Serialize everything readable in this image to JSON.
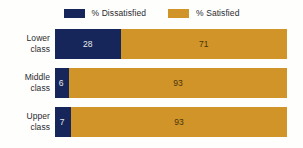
{
  "chart_data": {
    "type": "bar",
    "orientation": "horizontal",
    "stacked": true,
    "title": "",
    "subtitle": "",
    "xlabel": "",
    "ylabel": "",
    "xlim": [
      0,
      100
    ],
    "grid": false,
    "legend_position": "top-center",
    "categories": [
      "Lower class",
      "Middle class",
      "Upper class"
    ],
    "category_lines": [
      {
        "line1": "Lower",
        "line2": "class"
      },
      {
        "line1": "Middle",
        "line2": "class"
      },
      {
        "line1": "Upper",
        "line2": "class"
      }
    ],
    "series": [
      {
        "name": "% Dissatisfied",
        "color": "#16265a",
        "values": [
          28,
          6,
          7
        ]
      },
      {
        "name": "% Satisfied",
        "color": "#d09428",
        "values": [
          71,
          93,
          93
        ]
      }
    ],
    "data_labels": [
      {
        "dissatisfied": "28",
        "satisfied": "71"
      },
      {
        "dissatisfied": "6",
        "satisfied": "93"
      },
      {
        "dissatisfied": "7",
        "satisfied": "93"
      }
    ]
  },
  "legend": {
    "items": [
      {
        "label": "% Dissatisfied",
        "color": "#16265a",
        "swatch": "legend-swatch-dissatisfied"
      },
      {
        "label": "% Satisfied",
        "color": "#d09428",
        "swatch": "legend-swatch-satisfied"
      }
    ]
  },
  "colors": {
    "dissatisfied": "#16265a",
    "satisfied": "#d09428",
    "background": "#fefefd",
    "label_text": "#2b2b30",
    "value_on_navy": "#e9e9ee",
    "value_on_gold": "#4a3410"
  }
}
